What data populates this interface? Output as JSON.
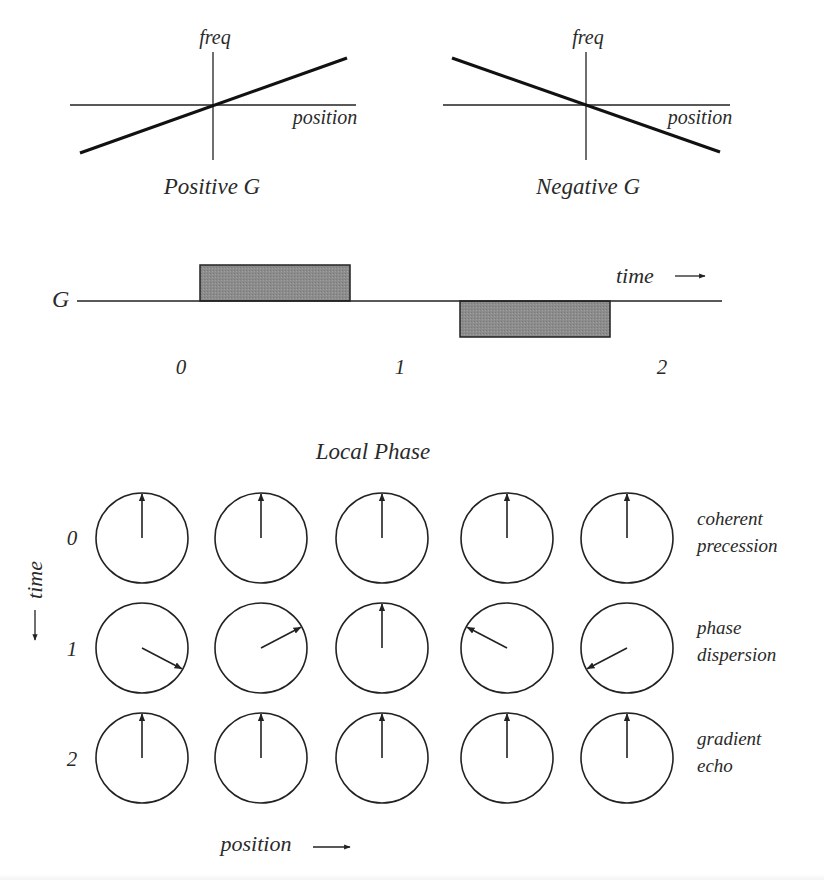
{
  "colors": {
    "ink": "#222222",
    "pulse_fill": "#8a8a8a",
    "background": "#ffffff"
  },
  "freq_plots": [
    {
      "id": "positive",
      "y_label": "freq",
      "x_label": "position",
      "title": "Positive G",
      "slope": "positive"
    },
    {
      "id": "negative",
      "y_label": "freq",
      "x_label": "position",
      "title": "Negative G",
      "slope": "negative"
    }
  ],
  "gradient_waveform": {
    "label": "G",
    "time_label": "time",
    "time_arrow": "→",
    "ticks": [
      "0",
      "1",
      "2"
    ],
    "pulses": [
      {
        "polarity": "positive",
        "from_tick": 0,
        "to_tick": 1
      },
      {
        "polarity": "negative",
        "from_tick": 1,
        "to_tick": 2
      }
    ]
  },
  "local_phase": {
    "title": "Local Phase",
    "time_axis_label": "time",
    "position_axis_label": "position",
    "position_arrow": "→",
    "rows": [
      {
        "time": "0",
        "description_line1": "coherent",
        "description_line2": "precession",
        "phase_angles_deg": [
          90,
          90,
          90,
          90,
          90
        ]
      },
      {
        "time": "1",
        "description_line1": "phase",
        "description_line2": "dispersion",
        "phase_angles_deg": [
          -28,
          28,
          90,
          152,
          208
        ]
      },
      {
        "time": "2",
        "description_line1": "gradient",
        "description_line2": "echo",
        "phase_angles_deg": [
          90,
          90,
          90,
          90,
          90
        ]
      }
    ]
  },
  "chart_data": {
    "type": "diagram",
    "title": "Local Phase",
    "panels": [
      {
        "name": "Positive G",
        "xlabel": "position",
        "ylabel": "freq",
        "relation": "freq increases linearly with position"
      },
      {
        "name": "Negative G",
        "xlabel": "position",
        "ylabel": "freq",
        "relation": "freq decreases linearly with position"
      },
      {
        "name": "G vs time",
        "ylabel": "G",
        "xlabel": "time",
        "ticks": [
          "0",
          "1",
          "2"
        ],
        "segments": [
          {
            "interval": "0-1",
            "G": "+"
          },
          {
            "interval": "1-2",
            "G": "-"
          }
        ]
      },
      {
        "name": "Local Phase grid",
        "rows": [
          "0",
          "1",
          "2"
        ],
        "columns": 5,
        "row_labels": [
          "coherent precession",
          "phase dispersion",
          "gradient echo"
        ],
        "phase_angles_deg": [
          [
            90,
            90,
            90,
            90,
            90
          ],
          [
            -28,
            28,
            90,
            152,
            208
          ],
          [
            90,
            90,
            90,
            90,
            90
          ]
        ]
      }
    ]
  }
}
